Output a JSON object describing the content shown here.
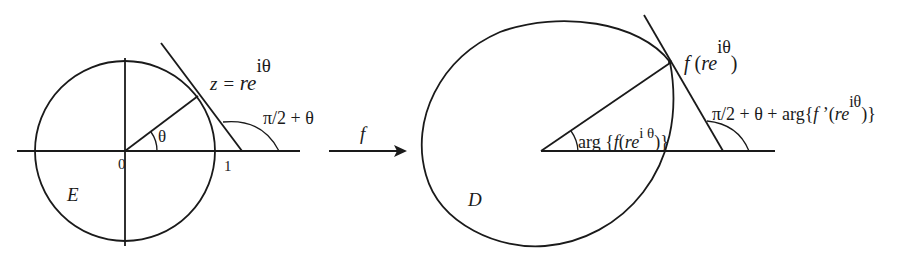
{
  "left_figure": {
    "region_label": "E",
    "origin_label": "0",
    "unit_label": "1",
    "angle_label": "θ",
    "point_label": {
      "prefix": "z = ",
      "base": "re",
      "exponent": "iθ"
    },
    "tangent_angle_label": "π/2 + θ"
  },
  "mapping": {
    "function_label": "f"
  },
  "right_figure": {
    "region_label": "D",
    "point_label": {
      "func": "f",
      "open": " (",
      "base": "re",
      "exponent": "iθ",
      "close": ")"
    },
    "arg_label": {
      "prefix": "arg {",
      "func": "f",
      "open": "(",
      "base": "re",
      "exponent": "i θ",
      "close": ")}"
    },
    "tangent_angle_label": {
      "prefix": "π/2 + θ + arg{",
      "func": "f",
      "prime": " ’",
      "open": "(",
      "base": "re",
      "exponent": "iθ",
      "close": ")}"
    }
  },
  "colors": {
    "ink": "#1a1a1a",
    "background": "#ffffff"
  }
}
